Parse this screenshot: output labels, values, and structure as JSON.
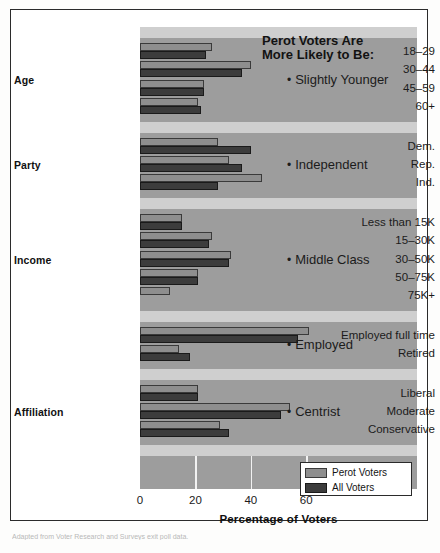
{
  "chart_data": {
    "type": "bar",
    "orientation": "horizontal",
    "title": "Perot Voters Are More Likely to Be:",
    "xlabel": "Percentage of Voters",
    "ylabel": "",
    "xlim": [
      0,
      70
    ],
    "xticks": [
      0,
      20,
      40,
      60
    ],
    "grid": true,
    "legend_position": "bottom-right",
    "legend": [
      "Perot Voters",
      "All Voters"
    ],
    "series": [
      {
        "name": "Perot Voters",
        "color": "#8e8e8e"
      },
      {
        "name": "All Voters",
        "color": "#3c3c3c"
      }
    ],
    "groups": [
      {
        "name": "Age",
        "annotation": "Slightly Younger",
        "categories": [
          "18–29",
          "30–44",
          "45–59",
          "60+"
        ],
        "perot": [
          26,
          40,
          23,
          21
        ],
        "all": [
          24,
          37,
          23,
          22
        ]
      },
      {
        "name": "Party",
        "annotation": "Independent",
        "categories": [
          "Dem.",
          "Rep.",
          "Ind."
        ],
        "perot": [
          28,
          32,
          44
        ],
        "all": [
          40,
          37,
          28
        ]
      },
      {
        "name": "Income",
        "annotation": "Middle Class",
        "categories": [
          "Less than 15K",
          "15–30K",
          "30–50K",
          "50–75K",
          "75K+"
        ],
        "perot": [
          15,
          26,
          33,
          21,
          11
        ],
        "all": [
          15,
          25,
          32,
          21,
          0
        ]
      },
      {
        "name": "",
        "annotation": "Employed",
        "categories": [
          "Employed full time",
          "Retired"
        ],
        "perot": [
          61,
          14
        ],
        "all": [
          57,
          18
        ]
      },
      {
        "name": "Affiliation",
        "annotation": "Centrist",
        "categories": [
          "Liberal",
          "Moderate",
          "Conservative"
        ],
        "perot": [
          21,
          54,
          29
        ],
        "all": [
          21,
          51,
          32
        ]
      }
    ]
  },
  "chart": {
    "callout_title_line1": "Perot Voters Are",
    "callout_title_line2": "More Likely to Be:",
    "axis_title": "Percentage of Voters",
    "xticks": [
      "0",
      "20",
      "40",
      "60"
    ],
    "group_labels": {
      "age": "Age",
      "party": "Party",
      "income": "Income",
      "affiliation": "Affiliation"
    },
    "annotations": {
      "age": "Slightly Younger",
      "party": "Independent",
      "income": "Middle Class",
      "employment": "Employed",
      "affiliation": "Centrist"
    },
    "legend": {
      "perot": "Perot Voters",
      "all": "All Voters"
    }
  },
  "colors": {
    "perot_bar": "#8e8e8e",
    "all_bar": "#3c3c3c",
    "plot_background": "#9d9d9d",
    "separator_band": "#cfcfcf",
    "gridline": "#f2f2f2",
    "frame": "#2b2b2b"
  },
  "caption": "Adapted from Voter Research and Surveys exit poll data."
}
